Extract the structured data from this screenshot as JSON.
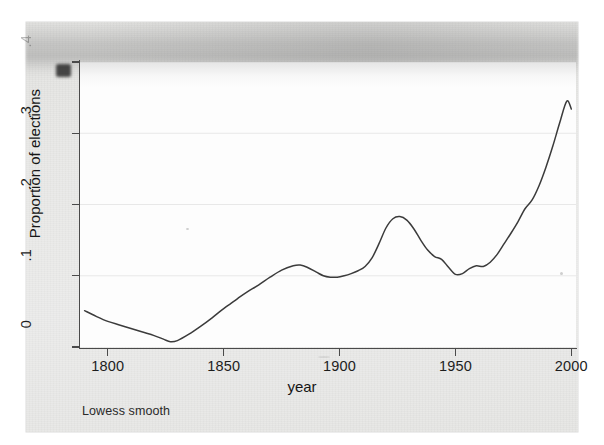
{
  "figure": {
    "footnote": "Lowess smooth",
    "line_color": "#3b3b3b",
    "grid_color": "#e8e8e8",
    "axis_color": "#4a4a4a",
    "paper_color": "#e9e9e7",
    "panel_color": "#fdfdfd"
  },
  "chart_data": {
    "type": "line",
    "title": "",
    "subtitle": "",
    "xlabel": "year",
    "ylabel": "Proportion of elections",
    "annotation": "Lowess smooth",
    "xlim": [
      1788,
      2002
    ],
    "ylim": [
      0,
      0.4
    ],
    "xticks": [
      1800,
      1850,
      1900,
      1950,
      2000
    ],
    "xticklabels": [
      "1800",
      "1850",
      "1900",
      "1950",
      "2000"
    ],
    "yticks": [
      0,
      0.1,
      0.2,
      0.3,
      0.4
    ],
    "yticklabels": [
      "0",
      ".1",
      ".2",
      ".3",
      ".4"
    ],
    "ytop_label_obscured": true,
    "grid": "horizontal",
    "legend": "none",
    "series": [
      {
        "name": "Proportion of elections (lowess smooth)",
        "x": [
          1790,
          1795,
          1800,
          1805,
          1810,
          1815,
          1820,
          1824,
          1827,
          1830,
          1835,
          1840,
          1845,
          1850,
          1853,
          1856,
          1860,
          1865,
          1870,
          1875,
          1880,
          1883,
          1886,
          1890,
          1893,
          1896,
          1899,
          1902,
          1905,
          1908,
          1911,
          1914,
          1917,
          1920,
          1923,
          1926,
          1929,
          1932,
          1935,
          1938,
          1941,
          1944,
          1947,
          1950,
          1953,
          1956,
          1959,
          1962,
          1965,
          1968,
          1971,
          1974,
          1977,
          1980,
          1983,
          1986,
          1989,
          1992,
          1995,
          1998,
          2000
        ],
        "y": [
          0.051,
          0.043,
          0.036,
          0.031,
          0.026,
          0.021,
          0.016,
          0.011,
          0.0075,
          0.009,
          0.018,
          0.029,
          0.041,
          0.054,
          0.061,
          0.068,
          0.077,
          0.087,
          0.098,
          0.108,
          0.114,
          0.115,
          0.112,
          0.105,
          0.1,
          0.098,
          0.098,
          0.1,
          0.103,
          0.107,
          0.113,
          0.125,
          0.145,
          0.167,
          0.18,
          0.183,
          0.178,
          0.166,
          0.15,
          0.136,
          0.127,
          0.123,
          0.112,
          0.102,
          0.103,
          0.11,
          0.114,
          0.113,
          0.119,
          0.13,
          0.145,
          0.16,
          0.176,
          0.194,
          0.206,
          0.226,
          0.252,
          0.282,
          0.315,
          0.345,
          0.334
        ]
      }
    ],
    "notable_points": [
      {
        "label": "start",
        "x": 1790,
        "y": 0.051
      },
      {
        "label": "minimum",
        "x": 1827,
        "y": 0.0075
      },
      {
        "label": "local-peak-1880s",
        "x": 1883,
        "y": 0.115
      },
      {
        "label": "local-trough-1890s",
        "x": 1897,
        "y": 0.098
      },
      {
        "label": "interwar-peak",
        "x": 1926,
        "y": 0.183
      },
      {
        "label": "postwar-trough",
        "x": 1950,
        "y": 0.102
      },
      {
        "label": "final-peak",
        "x": 1998,
        "y": 0.345
      },
      {
        "label": "end",
        "x": 2000,
        "y": 0.334
      }
    ]
  }
}
